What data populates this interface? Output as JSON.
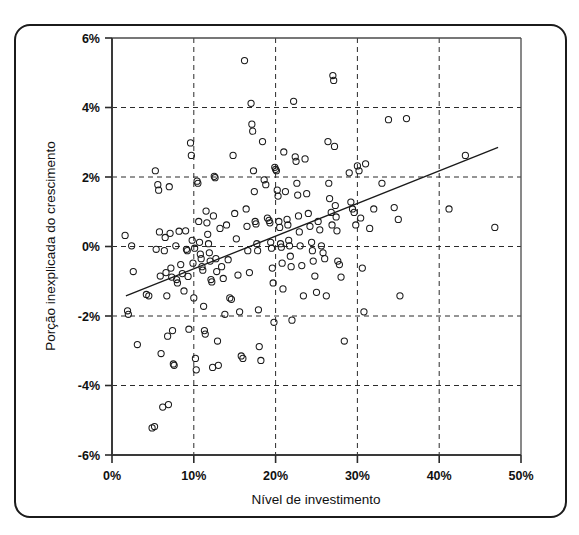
{
  "figure": {
    "frame": {
      "border_color": "#1b1b1b",
      "background": "#ffffff",
      "corner_radius": 16
    }
  },
  "chart_data": {
    "type": "scatter",
    "title": "",
    "xlabel": "Nível de investimento",
    "ylabel": "Porção inexplicada do crescimento",
    "xlim": [
      0,
      50
    ],
    "ylim": [
      -6,
      6
    ],
    "xtick_labels": [
      "0%",
      "10%",
      "20%",
      "30%",
      "40%",
      "50%"
    ],
    "xtick_values": [
      0,
      10,
      20,
      30,
      40,
      50
    ],
    "ytick_labels": [
      "6%",
      "4%",
      "2%",
      "0%",
      "-2%",
      "-4%",
      "-6%"
    ],
    "ytick_values": [
      6,
      4,
      2,
      0,
      -2,
      -4,
      -6
    ],
    "grid": "dashed-both-axes",
    "grid_color": "#2b2b2b",
    "legend": "none",
    "marker": {
      "shape": "open-circle",
      "radius": 3.1,
      "stroke": "#1a1a1a",
      "fill": "none"
    },
    "trendline": {
      "name": "linha de tendência",
      "color": "#1a1a1a",
      "x_start": 1.7,
      "y_start": -1.42,
      "x_end": 47.2,
      "y_end": 2.85
    },
    "points": [
      [
        1.6,
        0.32
      ],
      [
        1.9,
        -1.85
      ],
      [
        2.0,
        -1.95
      ],
      [
        2.4,
        0.02
      ],
      [
        2.6,
        -0.72
      ],
      [
        3.1,
        -2.82
      ],
      [
        4.2,
        -1.38
      ],
      [
        4.5,
        -1.42
      ],
      [
        4.9,
        -5.22
      ],
      [
        5.2,
        -5.18
      ],
      [
        5.3,
        2.18
      ],
      [
        5.4,
        -0.08
      ],
      [
        5.6,
        1.78
      ],
      [
        5.7,
        1.62
      ],
      [
        5.8,
        0.42
      ],
      [
        5.9,
        -0.85
      ],
      [
        6.0,
        -3.08
      ],
      [
        6.2,
        -4.62
      ],
      [
        6.4,
        -0.12
      ],
      [
        6.5,
        0.26
      ],
      [
        6.6,
        -0.75
      ],
      [
        6.7,
        -1.42
      ],
      [
        6.8,
        -2.58
      ],
      [
        6.9,
        -4.55
      ],
      [
        7.0,
        1.72
      ],
      [
        7.1,
        0.38
      ],
      [
        7.2,
        -0.62
      ],
      [
        7.3,
        -0.88
      ],
      [
        7.4,
        -2.42
      ],
      [
        7.5,
        -3.38
      ],
      [
        7.6,
        -3.42
      ],
      [
        7.8,
        0.02
      ],
      [
        7.9,
        -0.95
      ],
      [
        8.0,
        -1.05
      ],
      [
        8.2,
        0.44
      ],
      [
        8.4,
        -0.52
      ],
      [
        8.6,
        -0.78
      ],
      [
        8.8,
        -1.28
      ],
      [
        9.0,
        0.45
      ],
      [
        9.1,
        -0.08
      ],
      [
        9.2,
        -0.12
      ],
      [
        9.3,
        -0.86
      ],
      [
        9.4,
        -2.38
      ],
      [
        9.6,
        2.98
      ],
      [
        9.7,
        2.62
      ],
      [
        9.8,
        0.18
      ],
      [
        9.9,
        -0.48
      ],
      [
        10.0,
        -1.48
      ],
      [
        10.1,
        -0.05
      ],
      [
        10.2,
        -3.22
      ],
      [
        10.3,
        -3.55
      ],
      [
        10.4,
        1.88
      ],
      [
        10.5,
        1.82
      ],
      [
        10.6,
        0.72
      ],
      [
        10.7,
        0.12
      ],
      [
        10.8,
        -0.22
      ],
      [
        10.9,
        -0.35
      ],
      [
        11.0,
        -0.58
      ],
      [
        11.1,
        -0.68
      ],
      [
        11.2,
        -1.72
      ],
      [
        11.3,
        -2.42
      ],
      [
        11.4,
        -2.52
      ],
      [
        11.5,
        1.02
      ],
      [
        11.6,
        0.68
      ],
      [
        11.7,
        0.35
      ],
      [
        11.8,
        0.08
      ],
      [
        11.9,
        -0.18
      ],
      [
        12.0,
        -0.42
      ],
      [
        12.1,
        -0.95
      ],
      [
        12.2,
        -1.02
      ],
      [
        12.3,
        -3.48
      ],
      [
        12.4,
        0.88
      ],
      [
        12.5,
        2.02
      ],
      [
        12.6,
        1.98
      ],
      [
        12.7,
        -0.35
      ],
      [
        12.8,
        -0.72
      ],
      [
        12.9,
        -2.72
      ],
      [
        13.0,
        -3.42
      ],
      [
        13.2,
        0.52
      ],
      [
        13.4,
        -0.58
      ],
      [
        13.6,
        -0.92
      ],
      [
        13.8,
        -1.95
      ],
      [
        14.0,
        0.62
      ],
      [
        14.2,
        -0.38
      ],
      [
        14.4,
        -1.48
      ],
      [
        14.6,
        -1.52
      ],
      [
        14.8,
        2.62
      ],
      [
        15.0,
        0.95
      ],
      [
        15.2,
        0.22
      ],
      [
        15.4,
        -0.82
      ],
      [
        15.6,
        -1.88
      ],
      [
        15.8,
        -3.15
      ],
      [
        16.0,
        -3.22
      ],
      [
        16.2,
        5.35
      ],
      [
        16.4,
        1.08
      ],
      [
        16.5,
        0.58
      ],
      [
        16.6,
        -0.12
      ],
      [
        16.8,
        -0.75
      ],
      [
        17.0,
        4.12
      ],
      [
        17.1,
        3.52
      ],
      [
        17.2,
        3.32
      ],
      [
        17.3,
        2.18
      ],
      [
        17.4,
        1.58
      ],
      [
        17.5,
        0.72
      ],
      [
        17.6,
        0.65
      ],
      [
        17.7,
        0.08
      ],
      [
        17.8,
        -0.12
      ],
      [
        17.9,
        -1.82
      ],
      [
        18.0,
        -2.88
      ],
      [
        18.2,
        -3.28
      ],
      [
        18.4,
        3.02
      ],
      [
        18.6,
        1.92
      ],
      [
        18.8,
        1.78
      ],
      [
        19.0,
        0.82
      ],
      [
        19.2,
        0.75
      ],
      [
        19.3,
        0.68
      ],
      [
        19.4,
        0.12
      ],
      [
        19.5,
        -0.05
      ],
      [
        19.6,
        -0.62
      ],
      [
        19.7,
        -1.05
      ],
      [
        19.8,
        -2.18
      ],
      [
        19.9,
        2.28
      ],
      [
        20.0,
        2.22
      ],
      [
        20.1,
        2.18
      ],
      [
        20.2,
        1.62
      ],
      [
        20.3,
        1.45
      ],
      [
        20.4,
        0.72
      ],
      [
        20.5,
        0.55
      ],
      [
        20.6,
        0.08
      ],
      [
        20.7,
        -0.02
      ],
      [
        20.8,
        -0.48
      ],
      [
        20.9,
        -1.22
      ],
      [
        21.0,
        2.72
      ],
      [
        21.2,
        1.58
      ],
      [
        21.4,
        0.78
      ],
      [
        21.5,
        0.62
      ],
      [
        21.6,
        0.18
      ],
      [
        21.7,
        0.02
      ],
      [
        21.8,
        -0.28
      ],
      [
        21.9,
        -0.58
      ],
      [
        22.0,
        -2.12
      ],
      [
        22.2,
        4.18
      ],
      [
        22.4,
        2.58
      ],
      [
        22.5,
        2.45
      ],
      [
        22.6,
        1.82
      ],
      [
        22.7,
        1.48
      ],
      [
        22.8,
        0.88
      ],
      [
        22.9,
        0.42
      ],
      [
        23.0,
        0.02
      ],
      [
        23.2,
        -0.55
      ],
      [
        23.4,
        -1.42
      ],
      [
        23.6,
        2.52
      ],
      [
        23.8,
        1.52
      ],
      [
        24.0,
        0.95
      ],
      [
        24.2,
        0.58
      ],
      [
        24.4,
        0.12
      ],
      [
        24.5,
        -0.12
      ],
      [
        24.6,
        -0.42
      ],
      [
        24.8,
        -0.85
      ],
      [
        25.0,
        -1.32
      ],
      [
        25.2,
        0.72
      ],
      [
        25.4,
        0.48
      ],
      [
        25.6,
        0.02
      ],
      [
        25.8,
        -0.18
      ],
      [
        26.0,
        -0.35
      ],
      [
        26.2,
        -1.42
      ],
      [
        26.4,
        3.02
      ],
      [
        26.5,
        1.82
      ],
      [
        26.6,
        1.38
      ],
      [
        26.8,
        0.98
      ],
      [
        26.9,
        0.62
      ],
      [
        27.0,
        4.92
      ],
      [
        27.1,
        4.78
      ],
      [
        27.2,
        2.88
      ],
      [
        27.3,
        1.18
      ],
      [
        27.4,
        0.85
      ],
      [
        27.5,
        0.45
      ],
      [
        27.6,
        -0.42
      ],
      [
        27.8,
        -0.52
      ],
      [
        28.0,
        -0.88
      ],
      [
        28.4,
        -2.72
      ],
      [
        29.0,
        2.12
      ],
      [
        29.2,
        1.28
      ],
      [
        29.4,
        1.08
      ],
      [
        29.6,
        0.98
      ],
      [
        29.8,
        0.62
      ],
      [
        30.0,
        2.32
      ],
      [
        30.2,
        2.18
      ],
      [
        30.4,
        0.82
      ],
      [
        30.6,
        -0.62
      ],
      [
        30.8,
        -1.88
      ],
      [
        31.0,
        2.38
      ],
      [
        31.5,
        0.52
      ],
      [
        32.0,
        1.08
      ],
      [
        33.0,
        1.82
      ],
      [
        33.8,
        3.65
      ],
      [
        34.5,
        1.12
      ],
      [
        35.0,
        0.78
      ],
      [
        35.2,
        -1.42
      ],
      [
        36.0,
        3.68
      ],
      [
        41.2,
        1.08
      ],
      [
        43.2,
        2.62
      ],
      [
        46.8,
        0.55
      ]
    ]
  }
}
